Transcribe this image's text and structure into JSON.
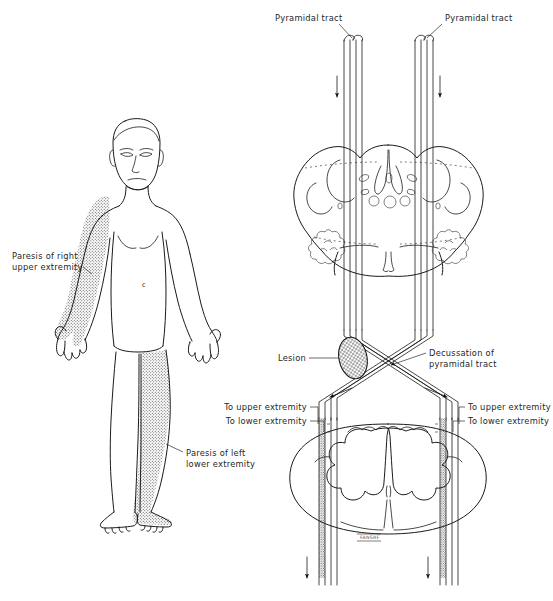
{
  "figure": {
    "colors": {
      "ink": "#1a1a1a",
      "label_text": "#1f1f1f",
      "paresis_stipple": "#4a4a4a",
      "background": "#ffffff",
      "lesion_fill": "#8a8a8a"
    }
  },
  "body_panel": {
    "name": "anterior human figure",
    "torso_mark": "c",
    "labels": [
      {
        "id": "paresis-right-upper",
        "line1": "Paresis of right",
        "line2": "upper extremity"
      },
      {
        "id": "paresis-left-lower",
        "line1": "Paresis of left",
        "line2": "lower extremity"
      }
    ],
    "shaded_regions": [
      "right upper extremity",
      "left lower extremity"
    ]
  },
  "neuro_panel": {
    "labels": {
      "pyramidal_tract_left": "Pyramidal tract",
      "pyramidal_tract_right": "Pyramidal tract",
      "lesion": "Lesion",
      "decussation_line1": "Decussation of",
      "decussation_line2": "pyramidal tract",
      "to_upper_left": "To upper extremity",
      "to_lower_left": "To lower extremity",
      "to_upper_right": "To upper extremity",
      "to_lower_right": "To lower extremity"
    },
    "sections": [
      {
        "id": "medulla",
        "name": "medulla oblongata cross-section"
      },
      {
        "id": "spinal-cord",
        "name": "spinal cord cross-section"
      }
    ],
    "artist_signature": "FANSRF",
    "flow_arrows": 6
  }
}
